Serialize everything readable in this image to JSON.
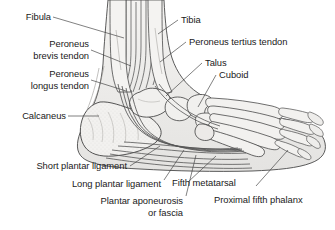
{
  "figure": {
    "background_color": "#ffffff",
    "text_color": "#1a1a1a",
    "leader_line_color": "#3c3c3c",
    "bone_fill_color": "#f0efed",
    "bone_outline_color": "#4a4a4a",
    "soft_tissue_color": "#e9e8e6"
  },
  "labels": {
    "fibula": "Fibula",
    "peroneus_brevis_tendon_line1": "Peroneus",
    "peroneus_brevis_tendon_line2": "brevis tendon",
    "peroneus_longus_tendon_line1": "Peroneus",
    "peroneus_longus_tendon_line2": "longus tendon",
    "calcaneus": "Calcaneus",
    "tibia": "Tibia",
    "peroneus_tertius_tendon": "Peroneus tertius tendon",
    "talus": "Talus",
    "cuboid": "Cuboid",
    "short_plantar_ligament": "Short plantar ligament",
    "long_plantar_ligament": "Long plantar ligament",
    "plantar_aponeurosis_line1": "Plantar aponeurosis",
    "plantar_aponeurosis_line2": "or fascia",
    "fifth_metatarsal": "Fifth metatarsal",
    "proximal_fifth_phalanx": "Proximal fifth phalanx"
  }
}
